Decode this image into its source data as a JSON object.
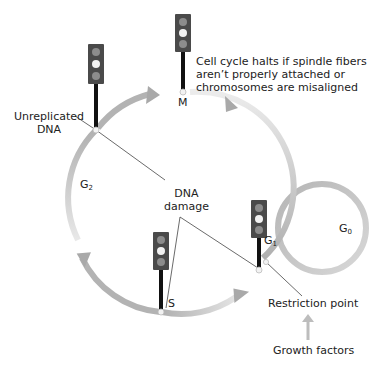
{
  "diagram": {
    "colors": {
      "arc": "#b3b3b3",
      "arc_fade": "#e6e6e6",
      "light_housing": "#4a4a4a",
      "light_off": "#8c8c8c",
      "light_on": "#f2f2f2",
      "pole": "#111111",
      "leader_line": "#333333",
      "text": "#222222"
    },
    "phases": {
      "m": "M",
      "g1_base": "G",
      "g1_sub": "1",
      "s": "S",
      "g2_base": "G",
      "g2_sub": "2",
      "g0_base": "G",
      "g0_sub": "0"
    },
    "labels": {
      "unreplicated_dna_line1": "Unreplicated",
      "unreplicated_dna_line2": "DNA",
      "dna_damage_line1": "DNA",
      "dna_damage_line2": "damage",
      "m_note_line1": "Cell cycle halts if spindle fibers",
      "m_note_line2": "aren’t properly attached or",
      "m_note_line3": "chromosomes are misaligned",
      "restriction_point": "Restriction point",
      "growth_factors": "Growth factors"
    },
    "checkpoints": [
      {
        "name": "G2 checkpoint (unreplicated DNA)",
        "x": 96,
        "y": 130
      },
      {
        "name": "M checkpoint",
        "x": 183,
        "y": 91
      },
      {
        "name": "S checkpoint",
        "x": 161,
        "y": 311
      },
      {
        "name": "G1 checkpoint",
        "x": 260,
        "y": 270
      }
    ]
  }
}
